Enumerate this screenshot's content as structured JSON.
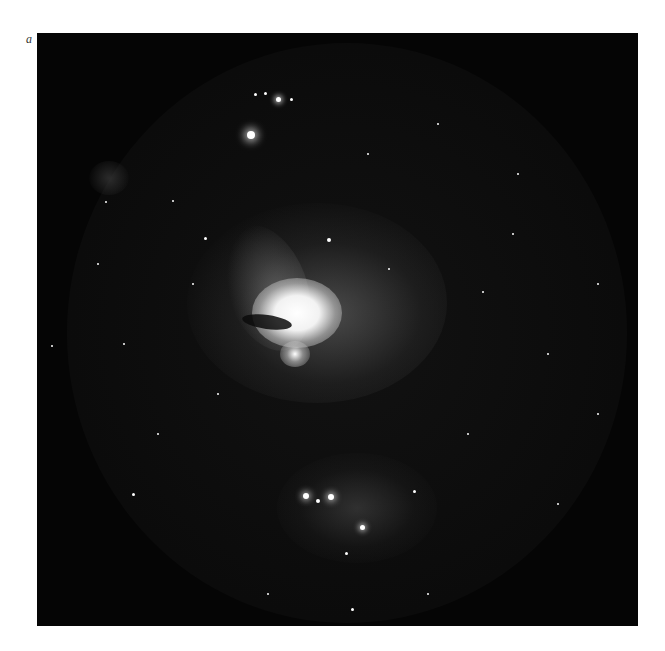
{
  "figure": {
    "panel_label": "a",
    "colors": {
      "background": "#ffffff",
      "sky": "#050505",
      "nebula": "#f0f0f0"
    }
  }
}
